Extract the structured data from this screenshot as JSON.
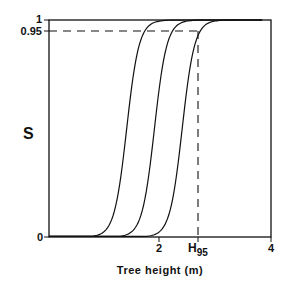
{
  "chart_data": {
    "type": "line",
    "title": "",
    "xlabel": "Tree height (m)",
    "ylabel": "S",
    "xlim": [
      0,
      4
    ],
    "ylim": [
      0,
      1
    ],
    "x_ticks": [
      {
        "value": 2,
        "label": "2"
      },
      {
        "value": 2.7,
        "label": "H",
        "subscript": "95"
      },
      {
        "value": 4,
        "label": "4"
      }
    ],
    "y_ticks": [
      {
        "value": 0,
        "label": "0"
      },
      {
        "value": 0.95,
        "label": "0.95"
      },
      {
        "value": 1,
        "label": "1"
      }
    ],
    "reference_lines": [
      {
        "orientation": "horizontal",
        "y": 0.95,
        "style": "dashed"
      },
      {
        "orientation": "vertical",
        "x": 2.7,
        "label": "H95",
        "style": "dashed"
      }
    ],
    "series": [
      {
        "name": "curve-1",
        "midpoint": 1.4,
        "x": [
          0,
          0.5,
          1.0,
          1.25,
          1.35,
          1.4,
          1.45,
          1.55,
          1.8,
          2.3,
          3.0
        ],
        "values": [
          0.01,
          0.02,
          0.08,
          0.3,
          0.45,
          0.5,
          0.55,
          0.7,
          0.92,
          0.99,
          1.0
        ]
      },
      {
        "name": "curve-2",
        "midpoint": 1.9,
        "x": [
          0,
          0.8,
          1.5,
          1.75,
          1.85,
          1.9,
          1.95,
          2.05,
          2.3,
          2.8,
          3.4
        ],
        "values": [
          0.005,
          0.015,
          0.08,
          0.3,
          0.45,
          0.5,
          0.55,
          0.7,
          0.92,
          0.99,
          1.0
        ]
      },
      {
        "name": "curve-3",
        "midpoint": 2.4,
        "x": [
          0,
          1.0,
          2.0,
          2.25,
          2.35,
          2.4,
          2.45,
          2.55,
          2.7,
          3.2,
          3.8
        ],
        "values": [
          0.003,
          0.01,
          0.08,
          0.3,
          0.45,
          0.5,
          0.55,
          0.7,
          0.95,
          0.99,
          1.0
        ]
      }
    ],
    "grid": false,
    "legend": null
  }
}
